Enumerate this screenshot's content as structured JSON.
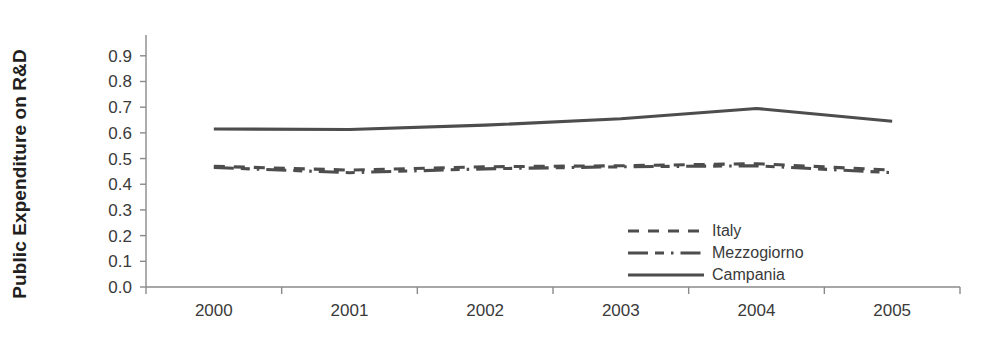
{
  "chart_data": {
    "type": "line",
    "title": "",
    "xlabel": "",
    "ylabel": "Public Expenditure on R&D",
    "categories": [
      "2000",
      "2001",
      "2002",
      "2003",
      "2004",
      "2005"
    ],
    "ylim": [
      0.0,
      0.9
    ],
    "ytick_labels": [
      "0.0",
      "0.1",
      "0.2",
      "0.3",
      "0.4",
      "0.5",
      "0.6",
      "0.7",
      "0.8",
      "0.9"
    ],
    "ytick_values": [
      0.0,
      0.1,
      0.2,
      0.3,
      0.4,
      0.5,
      0.6,
      0.7,
      0.8,
      0.9
    ],
    "grid": false,
    "legend_position": "inside-lower-right",
    "series": [
      {
        "name": "Italy",
        "style": "dashed",
        "color": "#4d4d4d",
        "values": [
          0.47,
          0.455,
          0.468,
          0.472,
          0.48,
          0.455
        ]
      },
      {
        "name": "Mezzogiorno",
        "style": "dash-dot",
        "color": "#4d4d4d",
        "values": [
          0.465,
          0.445,
          0.46,
          0.468,
          0.472,
          0.445
        ]
      },
      {
        "name": "Campania",
        "style": "solid",
        "color": "#4d4d4d",
        "values": [
          0.615,
          0.613,
          0.63,
          0.655,
          0.695,
          0.645
        ]
      }
    ]
  },
  "axis": {
    "y_title": "Public Expenditure on R&D",
    "tick_color": "#8a8a8a"
  },
  "legend": {
    "items": [
      {
        "label": "Italy",
        "style": "dashed"
      },
      {
        "label": "Mezzogiorno",
        "style": "dash-dot"
      },
      {
        "label": "Campania",
        "style": "solid"
      }
    ]
  }
}
